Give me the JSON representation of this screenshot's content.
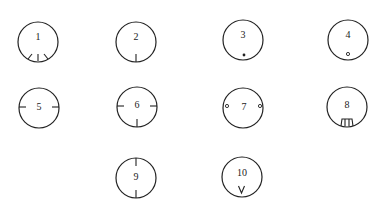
{
  "diagram": {
    "stroke_color": "#222222",
    "background": "#ffffff",
    "items": [
      {
        "label": "1",
        "cx": 38,
        "cy": 42,
        "r": 20,
        "feature": "three radial tick marks at bottom (fan of three slots)"
      },
      {
        "label": "2",
        "cx": 136,
        "cy": 42,
        "r": 20,
        "feature": "single tick mark at bottom"
      },
      {
        "label": "3",
        "cx": 243,
        "cy": 40,
        "r": 20,
        "feature": "small filled dot near bottom"
      },
      {
        "label": "4",
        "cx": 348,
        "cy": 40,
        "r": 20,
        "feature": "small hollow dot near bottom"
      },
      {
        "label": "5",
        "cx": 39,
        "cy": 108,
        "r": 20,
        "feature": "tick marks at left and right"
      },
      {
        "label": "6",
        "cx": 137,
        "cy": 107,
        "r": 20,
        "feature": "tick marks at left, right and bottom"
      },
      {
        "label": "7",
        "cx": 243,
        "cy": 108,
        "r": 20,
        "feature": "small hollow dots at left and right"
      },
      {
        "label": "8",
        "cx": 347,
        "cy": 107,
        "r": 20,
        "feature": "trapezoid key notch at bottom"
      },
      {
        "label": "9",
        "cx": 136,
        "cy": 178,
        "r": 20,
        "feature": "tick marks at top and bottom"
      },
      {
        "label": "10",
        "cx": 242,
        "cy": 177,
        "r": 20,
        "feature": "V-shaped mark at bottom"
      }
    ]
  }
}
